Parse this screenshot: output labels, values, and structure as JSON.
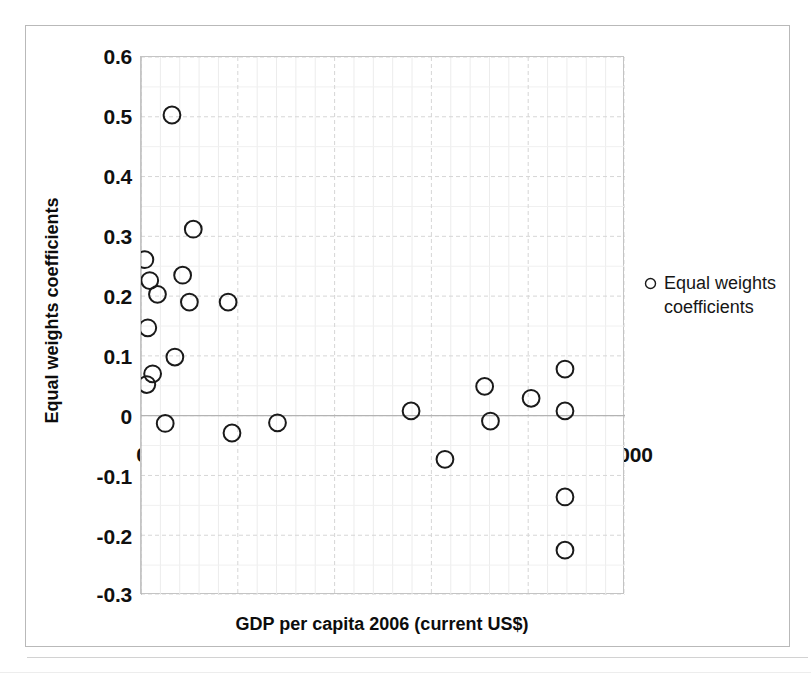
{
  "chart_data": {
    "type": "scatter",
    "title": "",
    "xlabel": "GDP per capita 2006 (current US$)",
    "ylabel": "Equal weights coefficients",
    "xlim": [
      0,
      50000
    ],
    "ylim": [
      -0.3,
      0.6
    ],
    "xticks": [
      0,
      10000,
      20000,
      30000,
      40000,
      50000
    ],
    "xtick_labels": [
      "0",
      "10000",
      "20000",
      "30000",
      "40000",
      "50000"
    ],
    "yticks": [
      -0.3,
      -0.2,
      -0.1,
      0,
      0.1,
      0.2,
      0.3,
      0.4,
      0.5,
      0.6
    ],
    "ytick_labels": [
      "-0.3",
      "-0.2",
      "-0.1",
      "0",
      "0.1",
      "0.2",
      "0.3",
      "0.4",
      "0.5",
      "0.6"
    ],
    "grid": true,
    "grid_color": "#d9d9d9",
    "minor_grid": true,
    "marker": "open-circle",
    "marker_color": "#1a1a1a",
    "legend_position": "right",
    "series": [
      {
        "name": "Equal weights coefficients",
        "points": [
          {
            "x": 3200,
            "y": 0.503
          },
          {
            "x": 5400,
            "y": 0.312
          },
          {
            "x": 400,
            "y": 0.261
          },
          {
            "x": 4300,
            "y": 0.235
          },
          {
            "x": 900,
            "y": 0.226
          },
          {
            "x": 1700,
            "y": 0.203
          },
          {
            "x": 5000,
            "y": 0.19
          },
          {
            "x": 9000,
            "y": 0.19
          },
          {
            "x": 700,
            "y": 0.147
          },
          {
            "x": 3500,
            "y": 0.098
          },
          {
            "x": 1200,
            "y": 0.07
          },
          {
            "x": 43800,
            "y": 0.078
          },
          {
            "x": 600,
            "y": 0.052
          },
          {
            "x": 35500,
            "y": 0.049
          },
          {
            "x": 40300,
            "y": 0.029
          },
          {
            "x": 27900,
            "y": 0.008
          },
          {
            "x": 43800,
            "y": 0.008
          },
          {
            "x": 2500,
            "y": -0.013
          },
          {
            "x": 14100,
            "y": -0.012
          },
          {
            "x": 9400,
            "y": -0.029
          },
          {
            "x": 36100,
            "y": -0.009
          },
          {
            "x": 31400,
            "y": -0.073
          },
          {
            "x": 43800,
            "y": -0.136
          },
          {
            "x": 43800,
            "y": -0.225
          }
        ]
      }
    ]
  },
  "legend": {
    "entries": [
      {
        "label_line1": "Equal weights",
        "label_line2": "coefficients",
        "marker": "open-circle"
      }
    ]
  },
  "axis_titles": {
    "x": "GDP per capita 2006 (current US$)",
    "y": "Equal weights coefficients"
  }
}
